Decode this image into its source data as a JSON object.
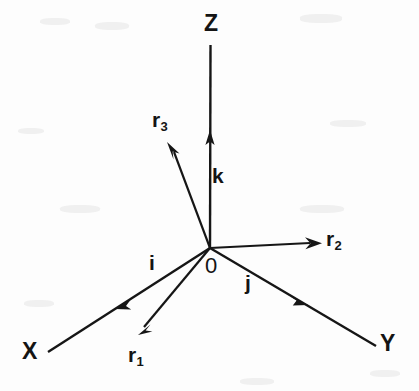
{
  "figure": {
    "background_color": "#fdfdfd",
    "ink_color": "#161616",
    "origin": {
      "label": "0",
      "x": 210,
      "y": 248
    },
    "axes": [
      {
        "name": "z-axis",
        "label": "Z",
        "label_x": 206,
        "label_y": 14,
        "from": [
          210,
          248
        ],
        "to": [
          210,
          45
        ]
      },
      {
        "name": "x-axis",
        "label": "X",
        "label_x": 24,
        "label_y": 342,
        "from": [
          210,
          248
        ],
        "to": [
          48,
          352
        ]
      },
      {
        "name": "y-axis",
        "label": "Y",
        "label_x": 382,
        "label_y": 334,
        "from": [
          210,
          248
        ],
        "to": [
          376,
          346
        ]
      }
    ],
    "unit_vectors": [
      {
        "name": "k",
        "label": "k",
        "label_x": 212,
        "label_y": 166,
        "from": [
          210,
          248
        ],
        "to": [
          210,
          133
        ]
      },
      {
        "name": "i",
        "label": "i",
        "label_x": 148,
        "label_y": 252,
        "from": [
          210,
          248
        ],
        "to": [
          118,
          307
        ]
      },
      {
        "name": "j",
        "label": "j",
        "label_x": 244,
        "label_y": 272,
        "from": [
          210,
          248
        ],
        "to": [
          306,
          304
        ]
      }
    ],
    "vectors": [
      {
        "name": "r1",
        "base": "r",
        "subscript": "1",
        "label_x": 128,
        "label_y": 345,
        "from": [
          210,
          248
        ],
        "to": [
          140,
          333
        ]
      },
      {
        "name": "r2",
        "base": "r",
        "subscript": "2",
        "label_x": 327,
        "label_y": 228,
        "from": [
          210,
          248
        ],
        "to": [
          320,
          243
        ]
      },
      {
        "name": "r3",
        "base": "r",
        "subscript": "3",
        "label_x": 152,
        "label_y": 110,
        "from": [
          210,
          248
        ],
        "to": [
          168,
          145
        ]
      }
    ]
  }
}
